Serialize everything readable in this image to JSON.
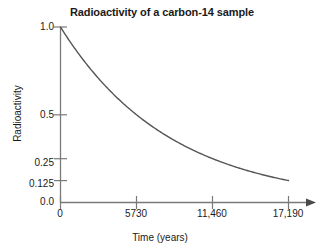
{
  "chart_data": {
    "type": "line",
    "title": "Radioactivity of a carbon-14 sample",
    "xlabel": "Time (years)",
    "ylabel": "Radioactivity",
    "xlim": [
      0,
      19000
    ],
    "ylim": [
      0,
      1.0
    ],
    "grid": false,
    "legend": "none",
    "x_ticks": [
      {
        "value": 0,
        "label": "0"
      },
      {
        "value": 5730,
        "label": "5730"
      },
      {
        "value": 11460,
        "label": "11,460"
      },
      {
        "value": 17190,
        "label": "17,190"
      }
    ],
    "y_ticks": [
      {
        "value": 1.0,
        "label": "1.0"
      },
      {
        "value": 0.5,
        "label": "0.5"
      },
      {
        "value": 0.25,
        "label": "0.25"
      },
      {
        "value": 0.125,
        "label": "0.125"
      },
      {
        "value": 0.0,
        "label": "0.0"
      }
    ],
    "series": [
      {
        "name": "carbon-14 decay",
        "half_life_years": 5730,
        "color": "#555555",
        "x": [
          0,
          1000,
          2000,
          3000,
          4000,
          5000,
          5730,
          7000,
          8000,
          9000,
          10000,
          11460,
          13000,
          14000,
          15000,
          16000,
          17190
        ],
        "y": [
          1.0,
          0.886,
          0.785,
          0.696,
          0.617,
          0.546,
          0.5,
          0.427,
          0.378,
          0.335,
          0.297,
          0.25,
          0.21,
          0.186,
          0.165,
          0.146,
          0.125
        ]
      }
    ],
    "annotations": []
  },
  "figure": {
    "background_color": "#ffffff",
    "axis_color": "#7a7a7a",
    "curve_color": "#555555",
    "text_color": "#1a1a1a",
    "has_x_arrow": true,
    "has_y_arrow": false
  }
}
